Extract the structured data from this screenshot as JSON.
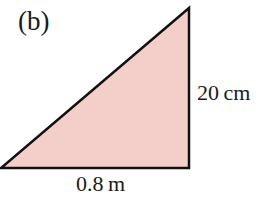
{
  "figure": {
    "part_label": "(b)",
    "shape": "right-triangle",
    "fill_color": "#f4cfc9",
    "stroke_color": "#111111",
    "vertices": [
      [
        1,
        168
      ],
      [
        189,
        168
      ],
      [
        189,
        8
      ]
    ],
    "dimensions": {
      "height": "20 cm",
      "base": "0.8 m"
    }
  }
}
